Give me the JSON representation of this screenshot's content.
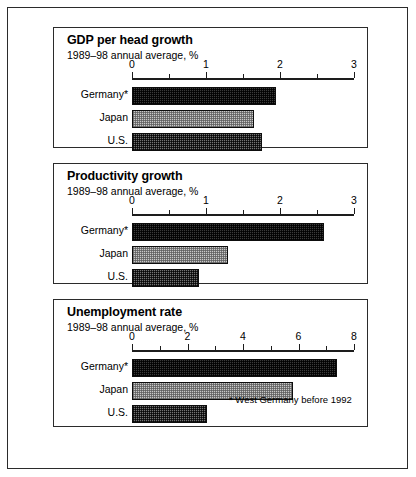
{
  "figure": {
    "footnote": "* West Germany before 1992"
  },
  "chart_data": [
    {
      "type": "bar",
      "orientation": "horizontal",
      "title": "GDP per head growth",
      "subtitle": "1989–98 annual average, %",
      "xlabel": "",
      "ylabel": "",
      "categories": [
        "Germany*",
        "Japan",
        "U.S."
      ],
      "values": [
        1.95,
        1.65,
        1.75
      ],
      "xlim": [
        0,
        3
      ],
      "ticks": [
        0,
        1,
        2,
        3
      ],
      "tick_labels": [
        "0",
        "1",
        "2",
        "3"
      ],
      "minor_ticks": [
        0.5,
        1.5,
        2.5
      ],
      "grid": false,
      "legend": "none"
    },
    {
      "type": "bar",
      "orientation": "horizontal",
      "title": "Productivity growth",
      "subtitle": "1989–98 annual average, %",
      "xlabel": "",
      "ylabel": "",
      "categories": [
        "Germany*",
        "Japan",
        "U.S."
      ],
      "values": [
        2.6,
        1.3,
        0.9
      ],
      "xlim": [
        0,
        3
      ],
      "ticks": [
        0,
        1,
        2,
        3
      ],
      "tick_labels": [
        "0",
        "1",
        "2",
        "3"
      ],
      "minor_ticks": [
        0.5,
        1.5,
        2.5
      ],
      "grid": false,
      "legend": "none"
    },
    {
      "type": "bar",
      "orientation": "horizontal",
      "title": "Unemployment rate",
      "subtitle": "1989–98 annual average, %",
      "xlabel": "",
      "ylabel": "",
      "categories": [
        "Germany*",
        "Japan",
        "U.S."
      ],
      "values": [
        7.4,
        5.8,
        2.7
      ],
      "xlim": [
        0,
        8
      ],
      "ticks": [
        0,
        2,
        4,
        6,
        8
      ],
      "tick_labels": [
        "0",
        "2",
        "4",
        "6",
        "8"
      ],
      "minor_ticks": [
        1,
        3,
        5,
        7
      ],
      "grid": false,
      "legend": "none",
      "annotation": "* West Germany before 1992"
    }
  ]
}
